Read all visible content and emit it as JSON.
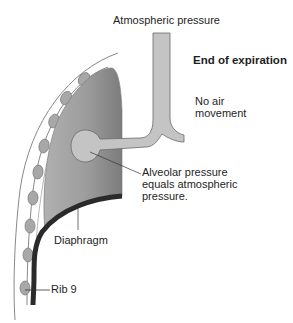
{
  "diagram": {
    "title": "End of expiration",
    "labels": {
      "atmospheric": "Atmospheric pressure",
      "state": "End of expiration",
      "air_line1": "No air",
      "air_line2": "movement",
      "alveolar_line1": "Alveolar pressure",
      "alveolar_line2": "equals atmospheric",
      "alveolar_line3": "pressure.",
      "diaphragm": "Diaphragm",
      "rib": "Rib 9"
    },
    "colors": {
      "lung": "#9a9a9a",
      "airway": "#c4c4c4",
      "rib": "#a8a8a8",
      "diaphragm": "#2a2a2a",
      "outline": "#6a6a6a",
      "text": "#1e1e1e"
    }
  }
}
